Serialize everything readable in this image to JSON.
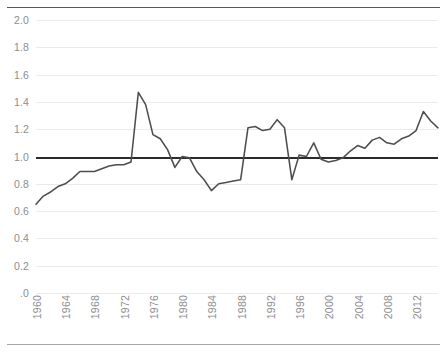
{
  "chart_data": {
    "type": "line",
    "title": "",
    "subtitle": "",
    "xlabel": "",
    "ylabel": "",
    "grid": true,
    "legend": false,
    "legend_position": "none",
    "xlim": [
      1960,
      2015
    ],
    "ylim": [
      0,
      2.0
    ],
    "y_ticks": [
      0,
      0.2,
      0.4,
      0.6,
      0.8,
      1.0,
      1.2,
      1.4,
      1.6,
      1.8,
      2.0
    ],
    "y_tick_labels": [
      ".0",
      "0.2",
      "0.4",
      "0.6",
      "0.8",
      "1.0",
      "1.2",
      "1.4",
      "1.6",
      "1.8",
      "2.0"
    ],
    "x_ticks": [
      1960,
      1964,
      1968,
      1972,
      1976,
      1980,
      1984,
      1988,
      1992,
      1996,
      2000,
      2004,
      2008,
      2012
    ],
    "x_tick_labels": [
      "1960",
      "1964",
      "1968",
      "1972",
      "1976",
      "1980",
      "1984",
      "1988",
      "1992",
      "1996",
      "2000",
      "2004",
      "2008",
      "2012"
    ],
    "reference_line": {
      "value": 1.0,
      "label": "",
      "color": "#2b2b2b",
      "width": 2.6
    },
    "series": [
      {
        "name": "index",
        "color": "#4d4d4f",
        "x": [
          1960,
          1961,
          1962,
          1963,
          1964,
          1965,
          1966,
          1967,
          1968,
          1969,
          1970,
          1971,
          1972,
          1973,
          1974,
          1975,
          1976,
          1977,
          1978,
          1979,
          1980,
          1981,
          1982,
          1983,
          1984,
          1985,
          1986,
          1987,
          1988,
          1989,
          1990,
          1991,
          1992,
          1993,
          1994,
          1995,
          1996,
          1997,
          1998,
          1999,
          2000,
          2001,
          2002,
          2003,
          2004,
          2005,
          2006,
          2007,
          2008,
          2009,
          2010,
          2011,
          2012,
          2013,
          2014,
          2015
        ],
        "values": [
          0.65,
          0.71,
          0.74,
          0.78,
          0.8,
          0.84,
          0.89,
          0.89,
          0.89,
          0.91,
          0.93,
          0.94,
          0.94,
          0.96,
          1.47,
          1.38,
          1.16,
          1.13,
          1.05,
          0.92,
          1.0,
          0.99,
          0.89,
          0.83,
          0.75,
          0.8,
          0.81,
          0.82,
          0.83,
          1.21,
          1.22,
          1.19,
          1.2,
          1.27,
          1.21,
          0.83,
          1.01,
          1.0,
          1.1,
          0.98,
          0.96,
          0.97,
          0.99,
          1.04,
          1.08,
          1.06,
          1.12,
          1.14,
          1.1,
          1.09,
          1.13,
          1.15,
          1.19,
          1.33,
          1.26,
          1.21
        ]
      }
    ],
    "annotations": []
  },
  "axes": {
    "y": {
      "ticks": [
        {
          "label": "2.0",
          "value": 2.0
        },
        {
          "label": "1.8",
          "value": 1.8
        },
        {
          "label": "1.6",
          "value": 1.6
        },
        {
          "label": "1.4",
          "value": 1.4
        },
        {
          "label": "1.2",
          "value": 1.2
        },
        {
          "label": "1.0",
          "value": 1.0
        },
        {
          "label": "0.8",
          "value": 0.8
        },
        {
          "label": "0.6",
          "value": 0.6
        },
        {
          "label": "0.4",
          "value": 0.4
        },
        {
          "label": "0.2",
          "value": 0.2
        },
        {
          "label": ".0",
          "value": 0
        }
      ]
    },
    "x": {
      "ticks": [
        {
          "label": "1960",
          "value": 1960
        },
        {
          "label": "1964",
          "value": 1964
        },
        {
          "label": "1968",
          "value": 1968
        },
        {
          "label": "1972",
          "value": 1972
        },
        {
          "label": "1976",
          "value": 1976
        },
        {
          "label": "1980",
          "value": 1980
        },
        {
          "label": "1984",
          "value": 1984
        },
        {
          "label": "1988",
          "value": 1988
        },
        {
          "label": "1992",
          "value": 1992
        },
        {
          "label": "1996",
          "value": 1996
        },
        {
          "label": "2000",
          "value": 2000
        },
        {
          "label": "2004",
          "value": 2004
        },
        {
          "label": "2008",
          "value": 2008
        },
        {
          "label": "2012",
          "value": 2012
        }
      ]
    }
  },
  "colors": {
    "series_line": "#4d4d4f",
    "reference_line": "#2b2b2b",
    "gridline": "#ebebeb",
    "tick_text": "#8d8d8f",
    "rule_top": "#58585a",
    "rule_bottom": "#a6a6a8",
    "background": "#ffffff"
  }
}
